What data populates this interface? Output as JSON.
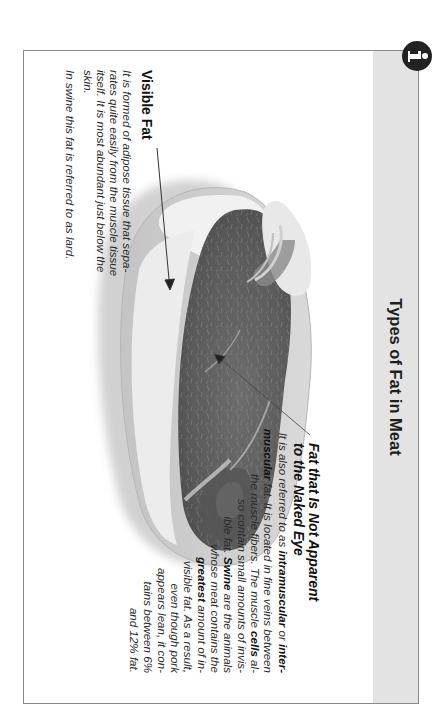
{
  "page": {
    "title": "Types of Fat in Meat",
    "orientation": "rotated-90-clockwise",
    "icon": "info-icon",
    "colors": {
      "header_band": "#e3e3e3",
      "frame_border": "#8a8a8a",
      "icon_bg": "#222222",
      "text": "#2a2a2a"
    }
  },
  "visible_fat": {
    "heading": "Visible Fat",
    "lines": [
      "It is formed of adipose tissue that sepa-",
      "rates quite easily from the muscle tissue",
      "itself. It is most abundant just below the",
      "skin."
    ],
    "note": "In swine this fat is referred to as lard."
  },
  "invisible_fat": {
    "heading_line1": "Fat that Is Not Apparent",
    "heading_line2": "to the Naked Eye",
    "lines": [
      [
        {
          "t": "It is also referred to as "
        },
        {
          "t": "intramuscular",
          "b": true
        },
        {
          "t": " or "
        },
        {
          "t": "inter-",
          "b": true
        }
      ],
      [
        {
          "t": "muscular",
          "b": true
        },
        {
          "t": " fat. It is located in fine veins between"
        }
      ],
      [
        {
          "t": "the muscle fibers. The muscle "
        },
        {
          "t": "cells",
          "b": true
        },
        {
          "t": " al-"
        }
      ],
      [
        {
          "t": "so contain small amounts of invis-"
        }
      ],
      [
        {
          "t": "ible fat. "
        },
        {
          "t": "Swine",
          "b": true
        },
        {
          "t": " are the animals"
        }
      ],
      [
        {
          "t": "whose meat contains the"
        }
      ],
      [
        {
          "t": "greatest",
          "b": true
        },
        {
          "t": " amount of in-"
        }
      ],
      [
        {
          "t": "visible fat. As a result,"
        }
      ],
      [
        {
          "t": "even though pork"
        }
      ],
      [
        {
          "t": "appears lean, it con-"
        }
      ],
      [
        {
          "t": "tains between 6%"
        }
      ],
      [
        {
          "t": "and 12% fat."
        }
      ]
    ]
  },
  "image": {
    "subject": "cross-section of a raw pork cut showing muscle and fat",
    "arrows": [
      {
        "label_ref": "visible_fat",
        "from": [
          148,
          288
        ],
        "to": [
          290,
          275
        ]
      },
      {
        "label_ref": "invisible_fat",
        "from": [
          435,
          135
        ],
        "to": [
          354,
          231
        ]
      }
    ]
  }
}
